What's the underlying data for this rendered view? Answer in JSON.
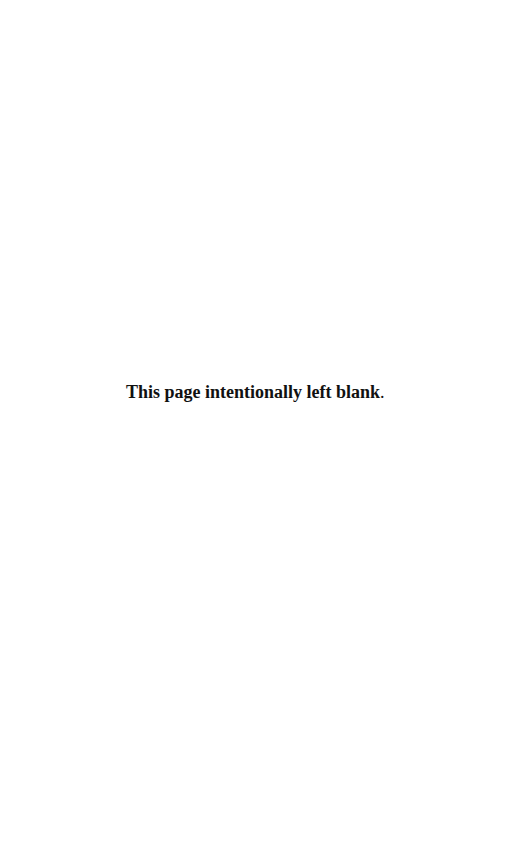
{
  "page": {
    "background": "#ffffff",
    "notice": {
      "text": "This page intentionally left blank",
      "punctuation": ".",
      "color": "#111111"
    }
  }
}
